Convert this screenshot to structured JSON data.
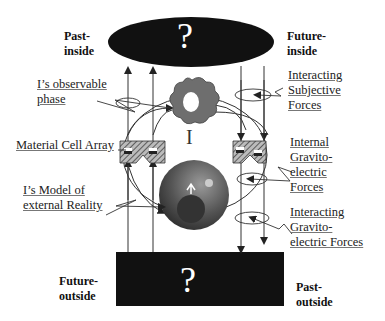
{
  "diagram": {
    "top_ellipse": {
      "symbol": "?"
    },
    "bottom_box": {
      "symbol": "?"
    },
    "center_label": "I",
    "corner_labels": {
      "past_inside": [
        "Past-",
        "inside"
      ],
      "future_inside": [
        "Future-",
        "inside"
      ],
      "future_outside": [
        "Future-",
        "outside"
      ],
      "past_outside": [
        "Past-",
        "outside"
      ]
    },
    "left_labels": {
      "observable_phase": [
        "I’s observable",
        "phase"
      ],
      "material_cell_array": [
        "Material Cell Array"
      ],
      "model_of_reality": [
        "I’s Model of",
        "external Reality"
      ]
    },
    "right_labels": {
      "interacting_subjective": [
        "Interacting",
        "Subjective",
        "Forces"
      ],
      "internal_gravito": [
        "Internal",
        "Gravito-",
        "electric",
        "Forces"
      ],
      "interacting_gravito": [
        "Interacting",
        "Gravito-",
        "electric Forces"
      ]
    },
    "colors": {
      "dark_shape": "#111111",
      "flower": "#6e6e6e",
      "sphere": "#5a5a5a",
      "line": "#333333"
    }
  }
}
